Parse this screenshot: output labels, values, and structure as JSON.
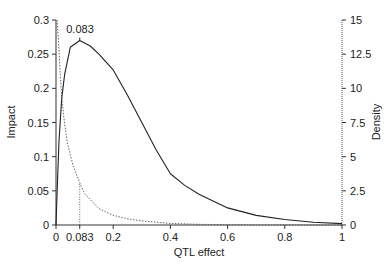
{
  "chart_data": {
    "type": "line",
    "title": "",
    "xlabel": "QTL effect",
    "ylabel": "Impact",
    "y2label": "Density",
    "xlim": [
      0,
      1
    ],
    "ylim": [
      0,
      0.3
    ],
    "y2lim": [
      0,
      15
    ],
    "x_ticks": [
      "0",
      "0.083",
      "0.2",
      "0.4",
      "0.6",
      "0.8",
      "1"
    ],
    "x_tick_values": [
      0,
      0.083,
      0.2,
      0.4,
      0.6,
      0.8,
      1
    ],
    "y_ticks": [
      "0",
      "0.05",
      "0.1",
      "0.15",
      "0.2",
      "0.25",
      "0.3"
    ],
    "y_tick_values": [
      0,
      0.05,
      0.1,
      0.15,
      0.2,
      0.25,
      0.3
    ],
    "y2_ticks": [
      "0",
      "2.5",
      "5",
      "7.5",
      "10",
      "12.5",
      "15"
    ],
    "y2_tick_values": [
      0,
      2.5,
      5,
      7.5,
      10,
      12.5,
      15
    ],
    "grid": false,
    "annotations": [
      {
        "text": "0.083",
        "x": 0.083,
        "y": 0.27,
        "note": "peak of impact curve"
      },
      {
        "type": "vline-dotted",
        "x": 0.083,
        "from": 0,
        "to_density": 3.1
      }
    ],
    "series": [
      {
        "name": "Impact",
        "axis": "left",
        "style": "solid",
        "x": [
          0,
          0.005,
          0.01,
          0.02,
          0.03,
          0.05,
          0.083,
          0.12,
          0.15,
          0.2,
          0.25,
          0.3,
          0.35,
          0.4,
          0.45,
          0.5,
          0.6,
          0.7,
          0.8,
          0.9,
          1.0
        ],
        "values": [
          0,
          0.06,
          0.12,
          0.185,
          0.22,
          0.26,
          0.27,
          0.262,
          0.25,
          0.227,
          0.19,
          0.15,
          0.11,
          0.075,
          0.058,
          0.045,
          0.025,
          0.014,
          0.008,
          0.004,
          0.002
        ]
      },
      {
        "name": "Density",
        "axis": "right",
        "style": "dotted",
        "x": [
          0.004,
          0.007,
          0.01,
          0.015,
          0.021,
          0.03,
          0.04,
          0.06,
          0.083,
          0.1,
          0.15,
          0.2,
          0.25,
          0.3,
          0.4,
          0.5,
          0.6,
          0.7,
          0.8,
          0.9,
          1.0
        ],
        "values": [
          15,
          14,
          13,
          11,
          9.1,
          7.4,
          6,
          4.3,
          3.1,
          2.3,
          1.2,
          0.7,
          0.45,
          0.3,
          0.12,
          0.05,
          0.02,
          0.01,
          0.005,
          0.002,
          0
        ]
      }
    ]
  }
}
